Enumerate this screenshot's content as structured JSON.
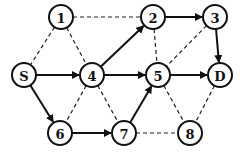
{
  "diagram": {
    "type": "directed-graph",
    "node_radius": 12,
    "nodes": [
      {
        "id": "1",
        "label": "1",
        "x": 61,
        "y": 17
      },
      {
        "id": "2",
        "label": "2",
        "x": 153,
        "y": 17
      },
      {
        "id": "3",
        "label": "3",
        "x": 215,
        "y": 17
      },
      {
        "id": "S",
        "label": "S",
        "x": 24,
        "y": 75
      },
      {
        "id": "4",
        "label": "4",
        "x": 92,
        "y": 75
      },
      {
        "id": "5",
        "label": "5",
        "x": 158,
        "y": 75
      },
      {
        "id": "D",
        "label": "D",
        "x": 220,
        "y": 75
      },
      {
        "id": "6",
        "label": "6",
        "x": 60,
        "y": 133
      },
      {
        "id": "7",
        "label": "7",
        "x": 124,
        "y": 133
      },
      {
        "id": "8",
        "label": "8",
        "x": 190,
        "y": 133
      }
    ],
    "solid_edges": [
      {
        "from": "S",
        "to": "4"
      },
      {
        "from": "S",
        "to": "6"
      },
      {
        "from": "4",
        "to": "2"
      },
      {
        "from": "4",
        "to": "5"
      },
      {
        "from": "2",
        "to": "3"
      },
      {
        "from": "3",
        "to": "D"
      },
      {
        "from": "5",
        "to": "D"
      },
      {
        "from": "6",
        "to": "7"
      },
      {
        "from": "7",
        "to": "5"
      }
    ],
    "dashed_edges": [
      {
        "from": "1",
        "to": "2"
      },
      {
        "from": "1",
        "to": "S"
      },
      {
        "from": "1",
        "to": "4"
      },
      {
        "from": "2",
        "to": "5"
      },
      {
        "from": "3",
        "to": "5"
      },
      {
        "from": "4",
        "to": "6"
      },
      {
        "from": "4",
        "to": "7"
      },
      {
        "from": "5",
        "to": "8"
      },
      {
        "from": "7",
        "to": "8"
      },
      {
        "from": "D",
        "to": "8"
      }
    ],
    "colors": {
      "stroke": "#111111",
      "background": "#ffffff"
    }
  }
}
